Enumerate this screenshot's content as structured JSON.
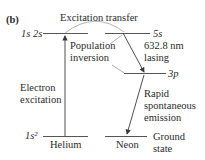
{
  "panel_label": "(b)",
  "title_transfer": "Excitation transfer",
  "helium": {
    "excited_level": "1s 2s",
    "ground_level": "1s²",
    "name": "Helium",
    "excitation_label_1": "Electron",
    "excitation_label_2": "excitation"
  },
  "neon": {
    "level_5s": "5s",
    "level_3p": "3p",
    "name": "Neon",
    "ground_1": "Ground",
    "ground_2": "state",
    "lasing_1": "632.8 nm",
    "lasing_2": "lasing",
    "emission_1": "Rapid",
    "emission_2": "spontaneous",
    "emission_3": "emission"
  },
  "inversion_1": "Population",
  "inversion_2": "inversion",
  "colors": {
    "line": "#3a3a3a",
    "arc": "#9a9a9a"
  }
}
